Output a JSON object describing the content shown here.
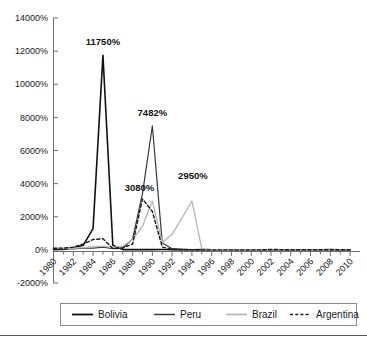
{
  "chart_data": {
    "type": "line",
    "title": "",
    "subtitle": "",
    "xlabel": "",
    "ylabel": "",
    "grid": false,
    "legend_position": "bottom",
    "xlim": [
      1980,
      2011
    ],
    "ylim": [
      -2000,
      14000
    ],
    "y_tick_labels": [
      "14000%",
      "12000%",
      "10000%",
      "8000%",
      "6000%",
      "4000%",
      "2000%",
      "0%",
      "-2000%"
    ],
    "y_tick_values": [
      14000,
      12000,
      10000,
      8000,
      6000,
      4000,
      2000,
      0,
      -2000
    ],
    "x_tick_labels": [
      "1980",
      "1982",
      "1984",
      "1986",
      "1988",
      "1990",
      "1992",
      "1994",
      "1996",
      "1998",
      "2000",
      "2002",
      "2004",
      "2006",
      "2008",
      "2010"
    ],
    "x_tick_values": [
      1980,
      1982,
      1984,
      1986,
      1988,
      1990,
      1992,
      1994,
      1996,
      1998,
      2000,
      2002,
      2004,
      2006,
      2008,
      2010
    ],
    "x_minor_step": 1,
    "series": [
      {
        "name": "Bolivia",
        "color": "#111111",
        "style": "solid",
        "width": 1.6,
        "x": [
          1980,
          1981,
          1982,
          1983,
          1984,
          1985,
          1986,
          1987,
          1988,
          1989,
          1990,
          1991,
          1992,
          1993,
          1994,
          1995,
          1996,
          1997,
          1998,
          1999,
          2000,
          2001,
          2002,
          2003,
          2004,
          2005,
          2006,
          2007,
          2008,
          2009,
          2010
        ],
        "y": [
          24,
          24,
          124,
          276,
          1281,
          11750,
          276,
          15,
          16,
          15,
          17,
          21,
          12,
          9,
          8,
          13,
          8,
          5,
          8,
          2,
          5,
          2,
          1,
          3,
          4,
          5,
          4,
          9,
          14,
          3,
          3
        ]
      },
      {
        "name": "Peru",
        "color": "#3a3a3a",
        "style": "solid",
        "width": 1.2,
        "x": [
          1980,
          1981,
          1982,
          1983,
          1984,
          1985,
          1986,
          1987,
          1988,
          1989,
          1990,
          1991,
          1992,
          1993,
          1994,
          1995,
          1996,
          1997,
          1998,
          1999,
          2000,
          2001,
          2002,
          2003,
          2004,
          2005,
          2006,
          2007,
          2008,
          2009,
          2010
        ],
        "y": [
          60,
          75,
          65,
          111,
          110,
          163,
          78,
          86,
          667,
          3399,
          7482,
          410,
          74,
          49,
          24,
          11,
          12,
          9,
          7,
          3,
          4,
          2,
          0,
          2,
          4,
          2,
          2,
          2,
          6,
          3,
          2
        ]
      },
      {
        "name": "Brazil",
        "color": "#b9b9b9",
        "style": "solid",
        "width": 1.4,
        "x": [
          1980,
          1981,
          1982,
          1983,
          1984,
          1985,
          1986,
          1987,
          1988,
          1989,
          1990,
          1991,
          1992,
          1993,
          1994,
          1995,
          1996,
          1997,
          1998,
          1999,
          2000,
          2001,
          2002,
          2003,
          2004,
          2005,
          2006,
          2007,
          2008,
          2009,
          2010
        ],
        "y": [
          90,
          101,
          101,
          135,
          192,
          226,
          147,
          228,
          629,
          1431,
          2948,
          433,
          952,
          1928,
          2950,
          66,
          16,
          7,
          3,
          5,
          7,
          7,
          8,
          15,
          7,
          7,
          4,
          4,
          6,
          5,
          5
        ]
      },
      {
        "name": "Argentina",
        "color": "#1a1a1a",
        "style": "dashed",
        "width": 1.4,
        "x": [
          1980,
          1981,
          1982,
          1983,
          1984,
          1985,
          1986,
          1987,
          1988,
          1989,
          1990,
          1991,
          1992,
          1993,
          1994,
          1995,
          1996,
          1997,
          1998,
          1999,
          2000,
          2001,
          2002,
          2003,
          2004,
          2005,
          2006,
          2007,
          2008,
          2009,
          2010
        ],
        "y": [
          101,
          105,
          165,
          344,
          627,
          672,
          90,
          131,
          343,
          3080,
          2314,
          172,
          25,
          11,
          4,
          3,
          0,
          0,
          1,
          1,
          1,
          1,
          26,
          14,
          4,
          10,
          11,
          9,
          9,
          6,
          11
        ]
      }
    ],
    "annotations": [
      {
        "text": "11750%",
        "x": 1985,
        "y": 11750,
        "series": "Bolivia"
      },
      {
        "text": "7482%",
        "x": 1990,
        "y": 7482,
        "series": "Peru"
      },
      {
        "text": "3080%",
        "x": 1989,
        "y": 3080,
        "series": "Argentina"
      },
      {
        "text": "2950%",
        "x": 1994,
        "y": 2950,
        "series": "Brazil"
      }
    ]
  },
  "legend": {
    "items": [
      {
        "label": "Bolivia"
      },
      {
        "label": "Peru"
      },
      {
        "label": "Brazil"
      },
      {
        "label": "Argentina"
      }
    ]
  }
}
